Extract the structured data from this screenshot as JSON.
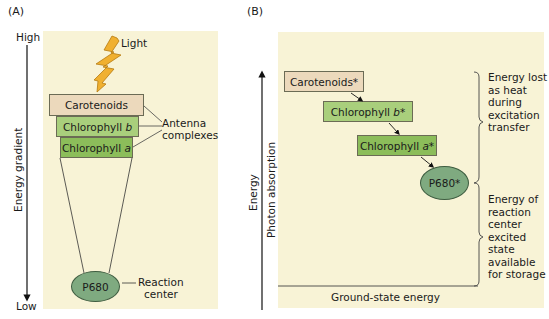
{
  "panel_a": {
    "label": "(A)",
    "axis": {
      "high": "High",
      "low": "Low",
      "title": "Energy gradient"
    },
    "light_label": "Light",
    "boxes": [
      {
        "text": "Carotenoids",
        "color": "#ecd9bc"
      },
      {
        "text_pre": "Chlorophyll ",
        "text_it": "b",
        "color": "#a9cf7c"
      },
      {
        "text_pre": "Chlorophyll ",
        "text_it": "a",
        "color": "#8cbd5a"
      }
    ],
    "antenna_label": [
      "Antenna",
      "complexes"
    ],
    "reaction_center": {
      "text": "P680",
      "label": [
        "Reaction",
        "center"
      ]
    }
  },
  "panel_b": {
    "label": "(B)",
    "axis_outer": "Energy",
    "axis_inner": "Photon absorption",
    "boxes": [
      {
        "text": "Carotenoids*"
      },
      {
        "text_pre": "Chlorophyll ",
        "text_it": "b",
        "text_post": "*"
      },
      {
        "text_pre": "Chlorophyll ",
        "text_it": "a",
        "text_post": "*"
      }
    ],
    "reaction_center": "P680*",
    "ground_state": "Ground-state energy",
    "brace_top": [
      "Energy lost",
      "as heat",
      "during",
      "excitation",
      "transfer"
    ],
    "brace_bottom": [
      "Energy of",
      "reaction",
      "center",
      "excited",
      "state",
      "available",
      "for storage"
    ]
  },
  "colors": {
    "panel_bg": "#f8f3d6",
    "carotenoid": "#ecd9bc",
    "chlorophyll_b": "#a9cf7c",
    "chlorophyll_a": "#8cbd5a",
    "p680": "#7faa80",
    "light": "#f0b030"
  }
}
